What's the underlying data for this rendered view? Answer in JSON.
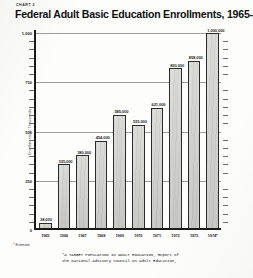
{
  "header": {
    "chart_tag": "CHART 2",
    "title": "Federal Adult Basic Education Enrollments, 1965-1974"
  },
  "notes": {
    "estimate": "* Estimate",
    "source_line1": "*A TARGET POPULATION IN ADULT EDUCATION, Report of",
    "source_line2": "the National Advisory Council on Adult Education,"
  },
  "colors": {
    "bar_fill": "#d4d4d0",
    "bar_stroke": "#2b2b2b",
    "gridline": "#8b8b8b",
    "axis": "#1b1b1b",
    "text": "#1a1a1a",
    "paper": "#fdfdfc"
  },
  "chart_data": {
    "type": "bar",
    "title": "Federal Adult Basic Education Enrollments, 1965-1974",
    "xlabel": "",
    "ylabel": "Enrollments in Thousands",
    "ylim": [
      0,
      1000
    ],
    "grid": true,
    "legend": "none",
    "ytick_labels": [
      "1,000",
      "750",
      "500",
      "250",
      "0"
    ],
    "ytick_values": [
      1000,
      750,
      500,
      250,
      0
    ],
    "minor_ticks_per_interval": 5,
    "categories": [
      "1965",
      "1966",
      "1967",
      "1968",
      "1969",
      "1970",
      "1971",
      "1972",
      "1973",
      "1974*"
    ],
    "values": [
      38,
      335,
      380,
      454,
      585,
      535,
      621,
      820,
      858,
      1000
    ],
    "data_labels": [
      "38,000",
      "335,000",
      "380,000",
      "454,000",
      "585,000",
      "535,000",
      "621,000",
      "820,000",
      "858,000",
      "1,000,000"
    ],
    "units": "enrollments",
    "annotations": [
      "* Estimate"
    ]
  }
}
